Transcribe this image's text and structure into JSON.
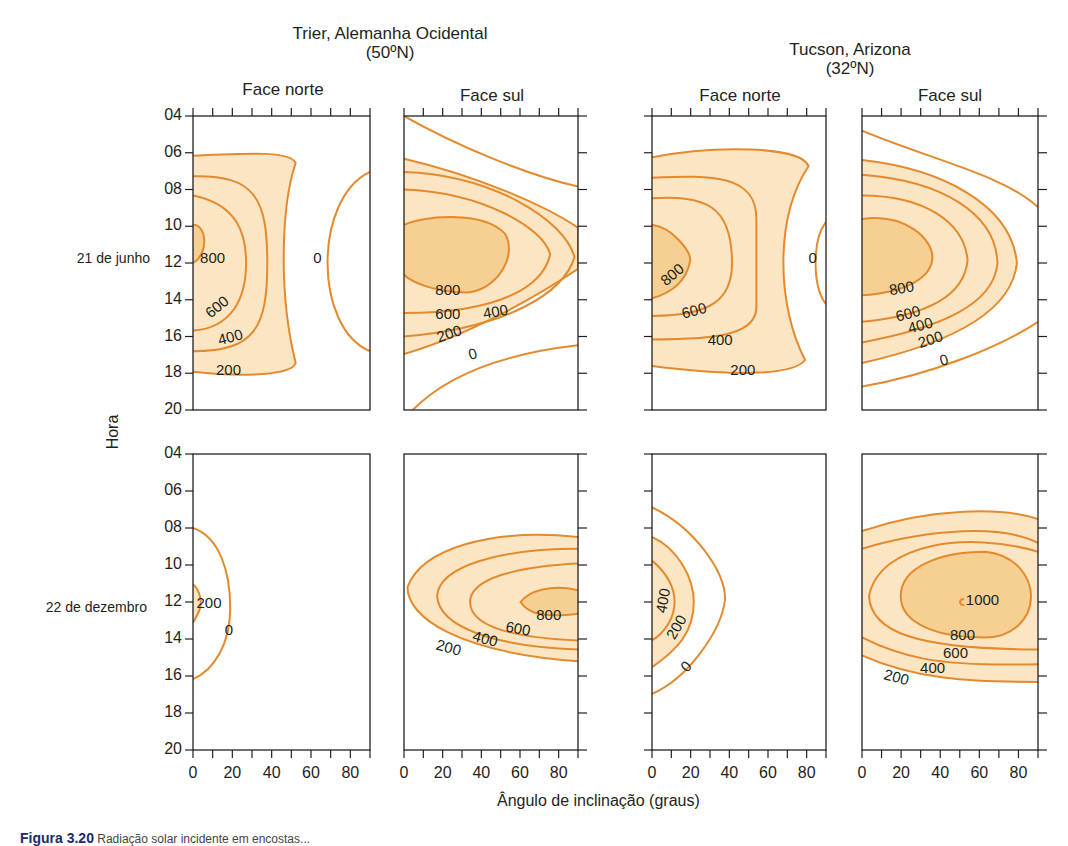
{
  "page": {
    "caption_prefix": "Figura 3.20",
    "caption_text": "Radiação solar incidente em encostas..."
  },
  "chart_data": {
    "type": "contour",
    "title": "",
    "xlabel": "Ângulo de inclinação (graus)",
    "ylabel": "Hora",
    "x_ticks": [
      "0",
      "20",
      "40",
      "60",
      "80"
    ],
    "y_ticks": [
      "04",
      "06",
      "08",
      "10",
      "12",
      "14",
      "16",
      "18",
      "20"
    ],
    "xlim": [
      0,
      90
    ],
    "ylim": [
      4,
      20
    ],
    "units_note": "Contours of incident solar radiation on slopes",
    "colors": {
      "line": "#e48a2e",
      "fill_light": "#fce5c2",
      "fill_dark": "#f6cf92",
      "frame": "#231f20"
    },
    "sites": [
      {
        "name": "Trier, Alemanha Ocidental",
        "latitude": "(50ºN)"
      },
      {
        "name": "Tucson, Arizona",
        "latitude": "(32ºN)"
      }
    ],
    "faces": [
      "Face norte",
      "Face sul",
      "Face norte",
      "Face sul"
    ],
    "rows": [
      {
        "label": "21 de junho"
      },
      {
        "label": "22 de dezembro"
      }
    ],
    "panels": [
      {
        "row": 0,
        "col": 0,
        "site": "Trier, Alemanha Ocidental",
        "face": "Face norte",
        "date": "21 de junho",
        "contour_levels": [
          0,
          200,
          400,
          600,
          800
        ],
        "max_region": "~850 near 0° slope at 12h",
        "fills": [
          {
            "tone": "light",
            "d": "M0,0.135 C0.35,0.125 0.55,0.12 0.58,0.16 C0.5,0.3 0.48,0.6 0.58,0.84 C0.56,0.88 0.3,0.89 0,0.87 Z"
          },
          {
            "tone": "dark",
            "d": "M0,0.37 C0.08,0.37 0.09,0.47 0,0.5 Z"
          }
        ],
        "lines": [
          {
            "d": "M0,0.135 C0.35,0.125 0.55,0.12 0.58,0.16 C0.5,0.3 0.48,0.6 0.58,0.84 C0.56,0.88 0.3,0.89 0,0.87"
          },
          {
            "d": "M0,0.205 C0.35,0.2 0.42,0.28 0.42,0.5 C0.42,0.72 0.35,0.8 0,0.8"
          },
          {
            "d": "M0,0.27 C0.25,0.3 0.3,0.4 0.3,0.5 C0.3,0.62 0.22,0.72 0,0.73"
          },
          {
            "d": "M0,0.37 C0.08,0.37 0.09,0.47 0,0.5"
          },
          {
            "d": "M1,0.19 C0.68,0.28 0.68,0.72 1,0.8"
          }
        ],
        "labels": [
          {
            "text": "800",
            "x": 0.04,
            "y": 0.5,
            "rot": 0
          },
          {
            "text": "0",
            "x": 0.68,
            "y": 0.5,
            "rot": 0
          },
          {
            "text": "600",
            "x": 0.1,
            "y": 0.69,
            "rot": -40
          },
          {
            "text": "400",
            "x": 0.15,
            "y": 0.78,
            "rot": -15
          },
          {
            "text": "200",
            "x": 0.13,
            "y": 0.88,
            "rot": 0
          }
        ]
      },
      {
        "row": 0,
        "col": 1,
        "site": "Trier, Alemanha Ocidental",
        "face": "Face sul",
        "date": "21 de junho",
        "contour_levels": [
          0,
          200,
          400,
          600,
          800
        ],
        "max_region": "~850 at 10-30° slope, 12h",
        "fills": [
          {
            "tone": "light",
            "d": "M0,0.145 C0.4,0.2 0.8,0.3 1,0.38 L1,0.52 C0.8,0.6 0.4,0.74 0,0.81 Z"
          },
          {
            "tone": "dark",
            "d": "M0,0.37 C0.1,0.34 0.45,0.32 0.58,0.4 C0.66,0.48 0.52,0.6 0.35,0.6 C0.2,0.6 0.05,0.57 0,0.54 Z"
          }
        ],
        "lines": [
          {
            "d": "M0,0.0 C0.3,0.1 0.7,0.2 1,0.24"
          },
          {
            "d": "M0,0.145 C0.4,0.2 0.8,0.3 1,0.38 L1,0.52 C0.8,0.6 0.4,0.74 0,0.81"
          },
          {
            "d": "M0,0.19 C0.5,0.2 0.92,0.35 0.98,0.48 C0.92,0.6 0.6,0.72 0,0.75"
          },
          {
            "d": "M0,0.25 C0.45,0.26 0.8,0.38 0.84,0.47 C0.8,0.58 0.55,0.67 0,0.67"
          },
          {
            "d": "M0,0.37 C0.1,0.34 0.45,0.32 0.58,0.4 C0.66,0.48 0.52,0.6 0.35,0.6 C0.2,0.6 0.05,0.57 0,0.54"
          },
          {
            "d": "M0.05,1 C0.3,0.85 0.7,0.8 1,0.78"
          }
        ],
        "labels": [
          {
            "text": "800",
            "x": 0.18,
            "y": 0.61,
            "rot": 0
          },
          {
            "text": "600",
            "x": 0.18,
            "y": 0.69,
            "rot": 0
          },
          {
            "text": "400",
            "x": 0.46,
            "y": 0.69,
            "rot": -10
          },
          {
            "text": "200",
            "x": 0.2,
            "y": 0.77,
            "rot": -18
          },
          {
            "text": "0",
            "x": 0.38,
            "y": 0.83,
            "rot": -15
          }
        ]
      },
      {
        "row": 0,
        "col": 2,
        "site": "Tucson, Arizona",
        "face": "Face norte",
        "date": "21 de junho",
        "contour_levels": [
          0,
          200,
          400,
          600,
          800
        ],
        "max_region": "~850 near 0° slope, 12h",
        "fills": [
          {
            "tone": "light",
            "d": "M0,0.14 C0.35,0.1 0.85,0.1 0.9,0.17 C0.7,0.35 0.72,0.65 0.88,0.83 C0.8,0.89 0.4,0.88 0,0.85 Z"
          },
          {
            "tone": "dark",
            "d": "M0,0.37 C0.12,0.38 0.22,0.46 0.22,0.49 C0.2,0.56 0.12,0.6 0,0.62 Z"
          }
        ],
        "lines": [
          {
            "d": "M0,0.14 C0.35,0.1 0.85,0.1 0.9,0.17 C0.7,0.35 0.72,0.65 0.88,0.83 C0.8,0.89 0.4,0.88 0,0.85"
          },
          {
            "d": "M0,0.21 C0.35,0.2 0.6,0.2 0.6,0.35 L0.6,0.65 C0.6,0.74 0.4,0.76 0,0.76"
          },
          {
            "d": "M0,0.28 C0.3,0.27 0.46,0.3 0.46,0.5 C0.46,0.62 0.35,0.68 0,0.68"
          },
          {
            "d": "M0,0.37 C0.12,0.38 0.22,0.46 0.22,0.49 C0.2,0.56 0.12,0.6 0,0.62"
          },
          {
            "d": "M1,0.36 C0.92,0.42 0.92,0.58 1,0.64"
          }
        ],
        "labels": [
          {
            "text": "800",
            "x": 0.08,
            "y": 0.58,
            "rot": -40
          },
          {
            "text": "600",
            "x": 0.18,
            "y": 0.69,
            "rot": -15
          },
          {
            "text": "400",
            "x": 0.32,
            "y": 0.78,
            "rot": 0
          },
          {
            "text": "200",
            "x": 0.45,
            "y": 0.88,
            "rot": 0
          },
          {
            "text": "0",
            "x": 0.9,
            "y": 0.5,
            "rot": 0
          }
        ]
      },
      {
        "row": 0,
        "col": 3,
        "site": "Tucson, Arizona",
        "face": "Face sul",
        "date": "21 de junho",
        "contour_levels": [
          0,
          200,
          400,
          600,
          800
        ],
        "max_region": "~850 near 0-30° slope, 12h",
        "fills": [
          {
            "tone": "light",
            "d": "M0,0.15 C0.45,0.18 0.85,0.3 0.88,0.5 C0.85,0.68 0.45,0.78 0,0.84 Z"
          },
          {
            "tone": "dark",
            "d": "M0,0.35 C0.25,0.33 0.4,0.42 0.4,0.48 C0.4,0.55 0.25,0.6 0,0.61 Z"
          }
        ],
        "lines": [
          {
            "d": "M0,0.05 C0.4,0.15 0.8,0.2 1,0.31"
          },
          {
            "d": "M0,0.15 C0.45,0.18 0.85,0.3 0.88,0.5 C0.85,0.68 0.45,0.78 0,0.84"
          },
          {
            "d": "M0,0.2 C0.45,0.22 0.76,0.33 0.77,0.5 C0.75,0.64 0.45,0.72 0,0.77"
          },
          {
            "d": "M0,0.27 C0.35,0.27 0.58,0.36 0.6,0.49 C0.58,0.62 0.35,0.68 0,0.7"
          },
          {
            "d": "M0,0.35 C0.25,0.33 0.4,0.42 0.4,0.48 C0.4,0.55 0.25,0.6 0,0.61"
          },
          {
            "d": "M0,0.92 C0.4,0.88 0.8,0.78 1,0.7"
          }
        ],
        "labels": [
          {
            "text": "800",
            "x": 0.16,
            "y": 0.61,
            "rot": -10
          },
          {
            "text": "600",
            "x": 0.2,
            "y": 0.7,
            "rot": -15
          },
          {
            "text": "400",
            "x": 0.27,
            "y": 0.74,
            "rot": -15
          },
          {
            "text": "200",
            "x": 0.33,
            "y": 0.79,
            "rot": -18
          },
          {
            "text": "0",
            "x": 0.45,
            "y": 0.85,
            "rot": -15
          }
        ]
      },
      {
        "row": 1,
        "col": 0,
        "site": "Trier, Alemanha Ocidental",
        "face": "Face norte",
        "date": "22 de dezembro",
        "contour_levels": [
          0,
          200
        ],
        "max_region": "~200 near 0° slope, 12h",
        "fills": [
          {
            "tone": "light",
            "d": "M0,0.44 C0.04,0.46 0.05,0.5 0.04,0.52 C0.03,0.54 0.01,0.56 0,0.57 Z"
          }
        ],
        "lines": [
          {
            "d": "M0,0.44 C0.04,0.46 0.05,0.5 0.04,0.52 C0.03,0.54 0.01,0.56 0,0.57"
          },
          {
            "d": "M0,0.25 C0.15,0.28 0.21,0.4 0.21,0.52 C0.21,0.64 0.12,0.73 0,0.76"
          }
        ],
        "labels": [
          {
            "text": "200",
            "x": 0.02,
            "y": 0.52,
            "rot": 0
          },
          {
            "text": "0",
            "x": 0.18,
            "y": 0.61,
            "rot": 0
          }
        ]
      },
      {
        "row": 1,
        "col": 1,
        "site": "Trier, Alemanha Ocidental",
        "face": "Face sul",
        "date": "22 de dezembro",
        "contour_levels": [
          200,
          400,
          600,
          800
        ],
        "max_region": "~850 at 70-90° slope, 12h",
        "fills": [
          {
            "tone": "light",
            "d": "M1,0.28 C0.5,0.25 0.1,0.32 0.02,0.45 C0.02,0.55 0.3,0.67 1,0.7 Z"
          },
          {
            "tone": "dark",
            "d": "M1,0.46 C0.85,0.44 0.72,0.46 0.67,0.5 C0.72,0.55 0.85,0.55 1,0.54 Z"
          }
        ],
        "lines": [
          {
            "d": "M1,0.28 C0.5,0.25 0.1,0.32 0.02,0.45 C0.02,0.55 0.3,0.67 1,0.7"
          },
          {
            "d": "M1,0.32 C0.55,0.32 0.2,0.38 0.19,0.48 C0.2,0.58 0.5,0.65 1,0.66"
          },
          {
            "d": "M1,0.37 C0.65,0.38 0.38,0.42 0.38,0.5 C0.38,0.58 0.6,0.62 1,0.63"
          },
          {
            "d": "M1,0.46 C0.85,0.44 0.72,0.46 0.67,0.5 C0.72,0.55 0.85,0.55 1,0.54"
          }
        ],
        "labels": [
          {
            "text": "800",
            "x": 0.76,
            "y": 0.56,
            "rot": 0
          },
          {
            "text": "600",
            "x": 0.58,
            "y": 0.6,
            "rot": 10
          },
          {
            "text": "400",
            "x": 0.39,
            "y": 0.63,
            "rot": 15
          },
          {
            "text": "200",
            "x": 0.18,
            "y": 0.66,
            "rot": 15
          }
        ]
      },
      {
        "row": 1,
        "col": 2,
        "site": "Tucson, Arizona",
        "face": "Face norte",
        "date": "22 de dezembro",
        "contour_levels": [
          0,
          200,
          400
        ],
        "max_region": "~450 near 0° slope, 12h",
        "fills": [
          {
            "tone": "light",
            "d": "M0,0.28 C0.15,0.32 0.24,0.42 0.24,0.5 C0.24,0.6 0.15,0.66 0,0.72 Z"
          }
        ],
        "lines": [
          {
            "d": "M0,0.18 C0.25,0.25 0.42,0.4 0.42,0.49 C0.4,0.6 0.2,0.76 0,0.81"
          },
          {
            "d": "M0,0.28 C0.15,0.32 0.24,0.42 0.24,0.5 C0.24,0.6 0.15,0.66 0,0.72"
          },
          {
            "d": "M0,0.36 C0.08,0.4 0.13,0.45 0.13,0.5 C0.13,0.55 0.08,0.6 0,0.63"
          }
        ],
        "labels": [
          {
            "text": "400",
            "x": 0.08,
            "y": 0.54,
            "rot": -80
          },
          {
            "text": "200",
            "x": 0.13,
            "y": 0.63,
            "rot": -60
          },
          {
            "text": "0",
            "x": 0.2,
            "y": 0.74,
            "rot": -45
          }
        ]
      },
      {
        "row": 1,
        "col": 3,
        "site": "Tucson, Arizona",
        "face": "Face sul",
        "date": "22 de dezembro",
        "contour_levels": [
          200,
          400,
          600,
          800,
          1000
        ],
        "max_region": "~1000 at ~55° slope, 12h",
        "fills": [
          {
            "tone": "light",
            "d": "M0,0.26 C0.4,0.18 0.8,0.18 1,0.22 L1,0.77 C0.6,0.77 0.3,0.76 0,0.68 Z"
          },
          {
            "tone": "dark",
            "d": "M0.7,0.33 C0.88,0.34 0.96,0.42 0.96,0.48 C0.96,0.56 0.85,0.62 0.7,0.62 C0.45,0.62 0.22,0.58 0.22,0.48 C0.22,0.38 0.45,0.33 0.7,0.33 Z"
          }
        ],
        "lines": [
          {
            "d": "M0,0.26 C0.4,0.18 0.8,0.18 1,0.22"
          },
          {
            "d": "M0,0.32 C0.4,0.25 0.8,0.24 1,0.3"
          },
          {
            "d": "M1,0.33 C0.6,0.26 0.1,0.3 0.04,0.48 C0.05,0.6 0.3,0.66 1,0.66"
          },
          {
            "d": "M0,0.62 C0.2,0.68 0.4,0.72 1,0.71"
          },
          {
            "d": "M0,0.68 C0.3,0.76 0.6,0.77 1,0.77"
          },
          {
            "d": "M0.7,0.33 C0.88,0.34 0.96,0.42 0.96,0.48 C0.96,0.56 0.85,0.62 0.7,0.62 C0.45,0.62 0.22,0.58 0.22,0.48 C0.22,0.38 0.45,0.33 0.7,0.33 Z"
          },
          {
            "d": "M0.58,0.49 C0.55,0.49 0.55,0.51 0.58,0.51"
          }
        ],
        "labels": [
          {
            "text": "1000",
            "x": 0.59,
            "y": 0.51,
            "rot": 0
          },
          {
            "text": "800",
            "x": 0.5,
            "y": 0.63,
            "rot": 0
          },
          {
            "text": "600",
            "x": 0.46,
            "y": 0.69,
            "rot": 0
          },
          {
            "text": "400",
            "x": 0.33,
            "y": 0.74,
            "rot": 0
          },
          {
            "text": "200",
            "x": 0.12,
            "y": 0.76,
            "rot": 15
          }
        ]
      }
    ]
  }
}
